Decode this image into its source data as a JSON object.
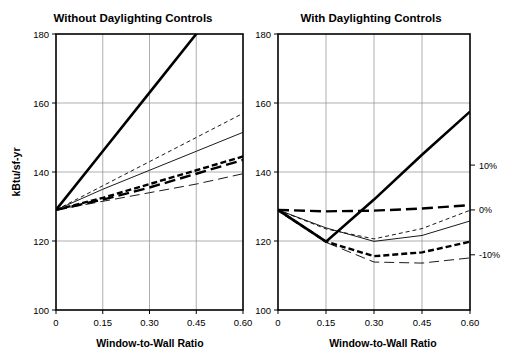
{
  "figure": {
    "left_axis_label": "kBtu/sf-yr",
    "x_axis_label": "Window-to-Wall Ratio"
  },
  "chart_data": [
    {
      "type": "line",
      "panel": "left",
      "title": "Without Daylighting Controls",
      "xlabel": "Window-to-Wall Ratio",
      "ylabel": "kBtu/sf-yr",
      "xlim": [
        0,
        0.6
      ],
      "ylim": [
        100,
        180
      ],
      "xticks": [
        0,
        0.15,
        0.3,
        0.45,
        0.6
      ],
      "xticklabels": [
        "0",
        "0.15",
        "0.30",
        "0.45",
        "0.60"
      ],
      "yticks": [
        100,
        120,
        140,
        160,
        180
      ],
      "yticklabels": [
        "100",
        "120",
        "140",
        "160",
        "180"
      ],
      "grid": true,
      "legend": "none",
      "x": [
        0,
        0.15,
        0.3,
        0.45,
        0.6
      ],
      "series": [
        {
          "name": "series-1-thick-solid",
          "style": "thick-solid",
          "values": [
            129,
            146,
            163,
            180,
            197
          ]
        },
        {
          "name": "series-2-thin-short-dash",
          "style": "thin-short-dash",
          "values": [
            129,
            136,
            143,
            150,
            157
          ]
        },
        {
          "name": "series-3-thin-solid",
          "style": "thin-solid",
          "values": [
            129,
            135,
            140.5,
            146,
            151.5
          ]
        },
        {
          "name": "series-4-thick-short-dash",
          "style": "thick-short-dash",
          "values": [
            129,
            132.5,
            136.5,
            140.5,
            144.5
          ]
        },
        {
          "name": "series-5-thick-long-dash",
          "style": "thick-long-dash",
          "values": [
            129,
            132,
            135.5,
            139.5,
            143.5
          ]
        },
        {
          "name": "series-6-thin-long-dash",
          "style": "thin-long-dash",
          "values": [
            129,
            131.5,
            134,
            136.5,
            139.5
          ]
        }
      ]
    },
    {
      "type": "line",
      "panel": "right",
      "title": "With Daylighting Controls",
      "xlabel": "Window-to-Wall Ratio",
      "ylabel": "kBtu/sf-yr",
      "xlim": [
        0,
        0.6
      ],
      "ylim": [
        100,
        180
      ],
      "xticks": [
        0,
        0.15,
        0.3,
        0.45,
        0.6
      ],
      "xticklabels": [
        "0",
        "0.15",
        "0.30",
        "0.45",
        "0.60"
      ],
      "yticks": [
        100,
        120,
        140,
        160,
        180
      ],
      "yticklabels": [
        "100",
        "120",
        "140",
        "160",
        "180"
      ],
      "secondary_axis": {
        "ticks": [
          10,
          0,
          -10
        ],
        "ticklabels": [
          "10%",
          "0%",
          "-10%"
        ],
        "tick_values_primary": [
          142,
          129,
          116
        ]
      },
      "grid": true,
      "legend": "none",
      "x": [
        0,
        0.15,
        0.3,
        0.45,
        0.6
      ],
      "series": [
        {
          "name": "series-1-thick-solid",
          "style": "thick-solid",
          "values": [
            129,
            119.8,
            132,
            145,
            157.5
          ]
        },
        {
          "name": "series-2-thick-long-dash",
          "style": "thick-long-dash",
          "values": [
            129,
            128.6,
            128.8,
            129.4,
            130.4
          ]
        },
        {
          "name": "series-3-thin-short-dash",
          "style": "thin-short-dash",
          "values": [
            129,
            123.5,
            120.6,
            123.6,
            128.9
          ]
        },
        {
          "name": "series-4-thin-solid",
          "style": "thin-solid",
          "values": [
            129,
            123.8,
            119.9,
            121.6,
            125.8
          ]
        },
        {
          "name": "series-5-thick-short-dash",
          "style": "thick-short-dash",
          "values": [
            129,
            119.8,
            115.6,
            116.7,
            119.8
          ]
        },
        {
          "name": "series-6-thin-long-dash",
          "style": "thin-long-dash",
          "values": [
            129,
            119.6,
            113.9,
            113.6,
            115.1
          ]
        }
      ]
    }
  ],
  "styles": {
    "thick-solid": {
      "width": 2.6,
      "dash": "none"
    },
    "thin-solid": {
      "width": 0.9,
      "dash": "none"
    },
    "thick-short-dash": {
      "width": 2.4,
      "dash": "6,3"
    },
    "thin-short-dash": {
      "width": 0.9,
      "dash": "4,3"
    },
    "thick-long-dash": {
      "width": 2.4,
      "dash": "11,5"
    },
    "thin-long-dash": {
      "width": 0.9,
      "dash": "10,5"
    }
  }
}
